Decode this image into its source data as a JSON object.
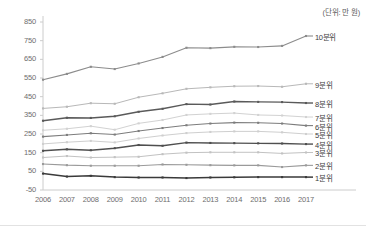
{
  "chart_data": {
    "type": "line",
    "title": "",
    "subtitle": "",
    "unit_note": "(단위: 만 원)",
    "xlabel": "",
    "ylabel": "",
    "x": [
      "2006",
      "2007",
      "2008",
      "2009",
      "2010",
      "2011",
      "2012",
      "2013",
      "2014",
      "2015",
      "2016",
      "2017"
    ],
    "categories": [
      "2006",
      "2007",
      "2008",
      "2009",
      "2010",
      "2011",
      "2012",
      "2013",
      "2014",
      "2015",
      "2016",
      "2017"
    ],
    "ylim": [
      -50,
      850
    ],
    "ytick_labels": [
      "850",
      "750",
      "650",
      "550",
      "450",
      "350",
      "250",
      "150",
      "50",
      "-50"
    ],
    "ytick_values": [
      850,
      750,
      650,
      550,
      450,
      350,
      250,
      150,
      50,
      -50
    ],
    "ytick_step": 100,
    "grid": false,
    "legend_position": "right-inline-at-line-end",
    "marker": "square",
    "series": [
      {
        "name": "10분위",
        "label": "10분위",
        "color": "#8c8c8c",
        "width": 1.1,
        "values": [
          541,
          572,
          610,
          598,
          628,
          663,
          712,
          710,
          717,
          716,
          722,
          775
        ]
      },
      {
        "name": "9분위",
        "label": "9분위",
        "color": "#b8b8b8",
        "width": 1.0,
        "values": [
          387,
          396,
          415,
          412,
          447,
          468,
          492,
          500,
          506,
          507,
          503,
          519
        ]
      },
      {
        "name": "8분위",
        "label": "8분위",
        "color": "#5a5a5a",
        "width": 1.4,
        "values": [
          321,
          337,
          336,
          345,
          369,
          385,
          410,
          408,
          424,
          422,
          421,
          416
        ]
      },
      {
        "name": "7분위",
        "label": "7분위",
        "color": "#d2d2d2",
        "width": 1.0,
        "values": [
          270,
          278,
          292,
          273,
          307,
          325,
          352,
          358,
          362,
          352,
          349,
          341
        ]
      },
      {
        "name": "6분위",
        "label": "6분위",
        "color": "#7d7d7d",
        "width": 1.1,
        "values": [
          236,
          245,
          254,
          247,
          266,
          282,
          297,
          306,
          311,
          310,
          306,
          295
        ]
      },
      {
        "name": "5분위",
        "label": "5분위",
        "color": "#cfcfcf",
        "width": 1.0,
        "values": [
          197,
          206,
          213,
          205,
          226,
          242,
          255,
          261,
          264,
          264,
          259,
          250
        ]
      },
      {
        "name": "4분위",
        "label": "4분위",
        "color": "#4f4f4f",
        "width": 1.4,
        "values": [
          160,
          168,
          163,
          174,
          191,
          187,
          204,
          202,
          201,
          200,
          199,
          196
        ]
      },
      {
        "name": "3분위",
        "label": "3분위",
        "color": "#c2c2c2",
        "width": 1.0,
        "values": [
          124,
          132,
          124,
          126,
          128,
          142,
          150,
          152,
          152,
          152,
          146,
          151
        ]
      },
      {
        "name": "2분위",
        "label": "2분위",
        "color": "#9a9a9a",
        "width": 1.1,
        "values": [
          89,
          83,
          80,
          80,
          80,
          87,
          85,
          83,
          82,
          82,
          73,
          82
        ]
      },
      {
        "name": "1분위",
        "label": "1분위",
        "color": "#3a3a3a",
        "width": 1.5,
        "values": [
          38,
          22,
          26,
          19,
          17,
          17,
          14,
          17,
          18,
          19,
          19,
          19
        ]
      }
    ]
  },
  "axes": {
    "y_axis_name": "income-amount",
    "x_axis_name": "year"
  }
}
